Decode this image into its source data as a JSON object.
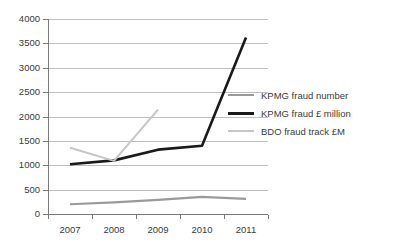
{
  "chart_data": {
    "type": "line",
    "title": "",
    "xlabel": "",
    "ylabel": "",
    "categories": [
      "2007",
      "2008",
      "2009",
      "2010",
      "2011"
    ],
    "ylim": [
      0,
      4000
    ],
    "yticks": [
      0,
      500,
      1000,
      1500,
      2000,
      2500,
      3000,
      3500,
      4000
    ],
    "ytick_labels": [
      "0",
      "500",
      "1000",
      "1500",
      "2000",
      "2500",
      "3000",
      "3500",
      "4000"
    ],
    "grid": true,
    "legend_position": "right",
    "series": [
      {
        "name": "KPMG fraud number",
        "color": "#9a9a9a",
        "width": 2.2,
        "values": [
          200,
          240,
          290,
          350,
          310
        ]
      },
      {
        "name": "KPMG fraud £ million",
        "color": "#1a1a1a",
        "width": 2.6,
        "values": [
          1020,
          1100,
          1320,
          1400,
          3620
        ]
      },
      {
        "name": "BDO fraud track £M",
        "color": "#c6c6c6",
        "width": 2.0,
        "values": [
          1360,
          1090,
          2140,
          null,
          null
        ]
      }
    ]
  },
  "legend": {
    "items": [
      {
        "label": "KPMG fraud number",
        "color": "#9a9a9a",
        "thickness": "2px"
      },
      {
        "label": "KPMG fraud £ million",
        "color": "#1a1a1a",
        "thickness": "3px"
      },
      {
        "label": "BDO fraud track £M",
        "color": "#c6c6c6",
        "thickness": "2px"
      }
    ]
  }
}
